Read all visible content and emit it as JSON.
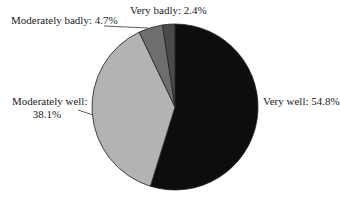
{
  "chart_data": {
    "type": "pie",
    "title": "",
    "slices": [
      {
        "label": "Very well",
        "value": 54.8,
        "display": "Very well: 54.8%",
        "color": "#0d0d0d"
      },
      {
        "label": "Moderately well",
        "value": 38.1,
        "display_line1": "Moderately well:",
        "display_line2": "38.1%",
        "color": "#b3b3b3"
      },
      {
        "label": "Moderately badly",
        "value": 4.7,
        "display": "Moderately badly: 4.7%",
        "color": "#6e6e6e"
      },
      {
        "label": "Very badly",
        "value": 2.4,
        "display": "Very badly: 2.4%",
        "color": "#4a4a4a"
      }
    ],
    "legend": "none (labels placed beside slices)"
  }
}
